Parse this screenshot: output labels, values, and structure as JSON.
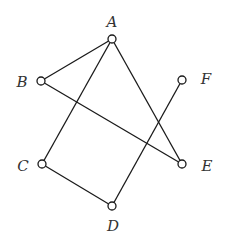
{
  "graph": {
    "nodes": [
      {
        "id": "A",
        "label": "A",
        "x": 112,
        "y": 39,
        "lx": 112,
        "ly": 27
      },
      {
        "id": "B",
        "label": "B",
        "x": 41,
        "y": 81,
        "lx": 22,
        "ly": 87
      },
      {
        "id": "C",
        "label": "C",
        "x": 42,
        "y": 164,
        "lx": 23,
        "ly": 171
      },
      {
        "id": "D",
        "label": "D",
        "x": 112,
        "y": 206,
        "lx": 113,
        "ly": 231
      },
      {
        "id": "E",
        "label": "E",
        "x": 182,
        "y": 164,
        "lx": 207,
        "ly": 171
      },
      {
        "id": "F",
        "label": "F",
        "x": 182,
        "y": 80,
        "lx": 206,
        "ly": 84
      }
    ],
    "edges": [
      {
        "from": "A",
        "to": "B"
      },
      {
        "from": "A",
        "to": "C"
      },
      {
        "from": "A",
        "to": "E"
      },
      {
        "from": "B",
        "to": "E"
      },
      {
        "from": "C",
        "to": "D"
      },
      {
        "from": "D",
        "to": "F"
      }
    ],
    "node_radius": 4,
    "colors": {
      "stroke": "#1a1a1a",
      "label": "#333333",
      "background": "#ffffff"
    }
  }
}
